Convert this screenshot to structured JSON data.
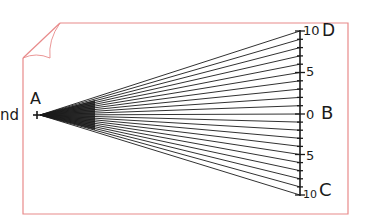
{
  "diagram": {
    "labels": {
      "side_text": "nd",
      "point_a": "A",
      "point_b": "B",
      "point_c": "C",
      "point_d": "D"
    },
    "scale": {
      "top_end": "10",
      "top_mid": "5",
      "center": "0",
      "bottom_mid": "5",
      "bottom_end": "10"
    },
    "colors": {
      "frame": "#e88a8a",
      "ink": "#1a1a1a",
      "background": "#ffffff"
    }
  }
}
